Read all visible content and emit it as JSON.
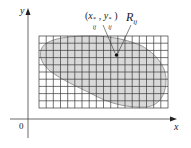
{
  "figure": {
    "axes": {
      "x_label": "x",
      "y_label": "y",
      "origin_label": "0"
    },
    "grid": {
      "columns": 18,
      "rows": 10,
      "line_color": "#3a3a3a"
    },
    "region": {
      "fill_color": "#d9d9d9",
      "stroke_color": "#9a9a9a"
    },
    "annotations": {
      "sample_point": "(x*ij, y*ij)",
      "sample_point_x": "x",
      "sample_point_x_sup": "*",
      "sample_point_x_sub": "ij",
      "sample_point_y": "y",
      "sample_point_y_sup": "*",
      "sample_point_y_sub": "ij",
      "subrectangle": "R",
      "subrectangle_sub": "ij"
    }
  }
}
